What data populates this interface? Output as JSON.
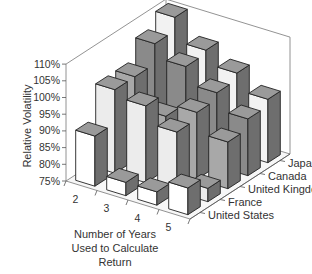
{
  "chart_data": {
    "type": "bar",
    "subtype": "3d-bar",
    "title": "",
    "xlabel": "Number of Years Used to Calculate Return",
    "ylabel": "Relative Volatility",
    "zlabel": "",
    "categories": [
      "2",
      "3",
      "4",
      "5"
    ],
    "series": [
      {
        "name": "United States",
        "values": [
          90,
          79,
          79,
          83
        ],
        "color": "#ffffff"
      },
      {
        "name": "France",
        "values": [
          100,
          98,
          93,
          79
        ],
        "color": "#ececec"
      },
      {
        "name": "United Kingdom",
        "values": [
          100,
          91,
          95,
          89
        ],
        "color": "#a8a8a8"
      },
      {
        "name": "Canada",
        "values": [
          106,
          102,
          97,
          92
        ],
        "color": "#8a8a8a"
      },
      {
        "name": "Japan",
        "values": [
          110,
          103,
          99,
          94
        ],
        "color": "#f2f2f2"
      }
    ],
    "yticks": [
      "75%",
      "80%",
      "85%",
      "90%",
      "95%",
      "100%",
      "105%",
      "110%"
    ],
    "ylim": [
      75,
      110
    ],
    "grid": false,
    "legend": "depth-axis labels"
  },
  "axes": {
    "ylabel": "Relative Volatility",
    "xlabel_lines": [
      "Number of Years",
      "Used to Calculate",
      "Return"
    ]
  }
}
